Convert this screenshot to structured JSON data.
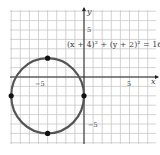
{
  "chart_data": {
    "type": "scatter",
    "title": "",
    "equation": "(x + 4)² + (y + 2)² = 16",
    "xlabel": "x",
    "ylabel": "y",
    "xlim": [
      -8,
      8
    ],
    "ylim": [
      -7,
      7
    ],
    "grid": true,
    "x_ticks_labeled": [
      -5,
      5
    ],
    "y_ticks_labeled": [
      5,
      -5
    ],
    "tick_labels": {
      "x_neg": "−5",
      "x_pos": "5",
      "y_pos": "5",
      "y_neg": "−5"
    },
    "circle": {
      "center": [
        -4,
        -2
      ],
      "radius": 4
    },
    "points": [
      {
        "x": -4,
        "y": 2
      },
      {
        "x": -8,
        "y": -2
      },
      {
        "x": 0,
        "y": -2
      },
      {
        "x": -4,
        "y": -6
      }
    ]
  },
  "colors": {
    "grid": "#c8c8c8",
    "axis": "#222222",
    "curve": "#555555",
    "point": "#111111"
  }
}
